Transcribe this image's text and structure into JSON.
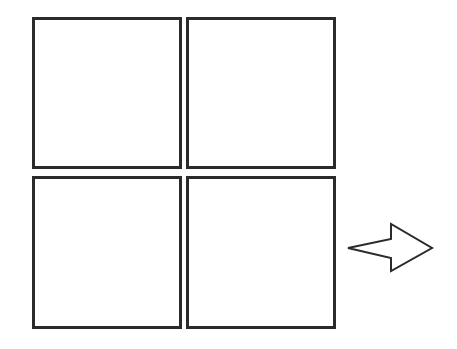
{
  "diagram": {
    "stroke_color": "#2b2b2b",
    "background": "#ffffff",
    "panels": [
      {
        "id": "top-left",
        "x": 32,
        "y": 17,
        "w": 150,
        "h": 152
      },
      {
        "id": "top-right",
        "x": 186,
        "y": 17,
        "w": 150,
        "h": 152
      },
      {
        "id": "bottom-left",
        "x": 32,
        "y": 176,
        "w": 150,
        "h": 153
      },
      {
        "id": "bottom-right",
        "x": 186,
        "y": 176,
        "w": 150,
        "h": 153
      }
    ],
    "arrow": {
      "direction": "right",
      "points": "348,248 391,239 391,224 432,248 391,271 391,258"
    }
  }
}
